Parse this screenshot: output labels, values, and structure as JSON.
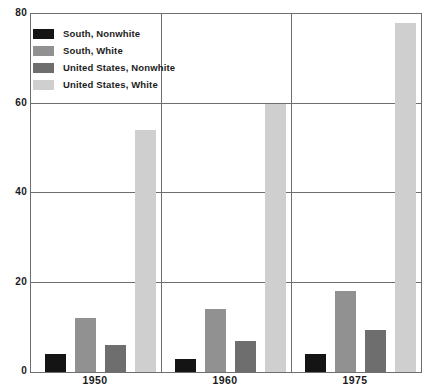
{
  "chart_data": {
    "type": "bar",
    "title": "",
    "subtitle": "",
    "xlabel": "",
    "ylabel": "",
    "categories": [
      "1950",
      "1960",
      "1975"
    ],
    "ylim": [
      0,
      80
    ],
    "yticks": [
      0,
      20,
      40,
      60,
      80
    ],
    "ytick_labels": [
      "0",
      "20",
      "40",
      "60",
      "80"
    ],
    "grid": true,
    "grid_axis": "y",
    "legend_position": "top-left",
    "panel_dividers": true,
    "series": [
      {
        "name": "South, Nonwhite",
        "color": "#141414",
        "values": [
          4,
          3,
          4
        ]
      },
      {
        "name": "South, White",
        "color": "#919191",
        "values": [
          12,
          14,
          18
        ]
      },
      {
        "name": "United States, Nonwhite",
        "color": "#6e6e6e",
        "values": [
          6,
          7,
          9.5
        ]
      },
      {
        "name": "United States, White",
        "color": "#cfcfcf",
        "values": [
          54,
          60,
          78
        ]
      }
    ]
  },
  "legend": {
    "items": [
      {
        "label": "South, Nonwhite",
        "color": "#141414"
      },
      {
        "label": "South, White",
        "color": "#919191"
      },
      {
        "label": "United States, Nonwhite",
        "color": "#6e6e6e"
      },
      {
        "label": "United States, White",
        "color": "#cfcfcf"
      }
    ]
  },
  "axes": {
    "y_tick_labels": [
      "80",
      "60",
      "40",
      "20",
      "0"
    ],
    "x_tick_labels": [
      "1950",
      "1960",
      "1975"
    ]
  },
  "colors": {
    "axis": "#6e6e6e",
    "text": "#1a1a1a",
    "background": "#ffffff"
  }
}
